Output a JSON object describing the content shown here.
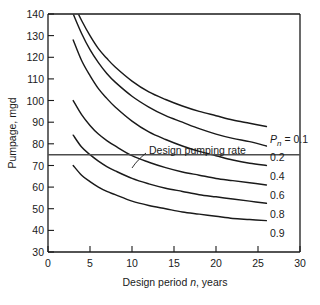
{
  "chart_data": {
    "type": "line",
    "title": "",
    "xlabel": "Design period n, years",
    "ylabel": "Pumpage, mgd",
    "xlim": [
      0,
      30
    ],
    "ylim": [
      30,
      140
    ],
    "xticks": [
      0,
      5,
      10,
      15,
      20,
      25,
      30
    ],
    "xtick_labels": [
      "0",
      "5",
      "10",
      "15",
      "20",
      "25",
      "30"
    ],
    "yticks": [
      30,
      40,
      50,
      60,
      70,
      80,
      90,
      100,
      110,
      120,
      130,
      140
    ],
    "ytick_labels": [
      "30",
      "40",
      "50",
      "60",
      "70",
      "80",
      "90",
      "100",
      "110",
      "120",
      "130",
      "140"
    ],
    "grid": false,
    "legend_position": "right-inline",
    "series_param_symbol": "P",
    "series_param_subscript": "n",
    "series": [
      {
        "name": "Pn = 0.1",
        "label": "0.1",
        "label_prefix": "P",
        "label_subscript": "n",
        "label_equals": "= 0.1",
        "x": [
          3,
          4,
          5,
          6,
          7,
          8,
          10,
          12,
          14,
          16,
          18,
          20,
          22,
          24,
          26
        ],
        "y": [
          145,
          137,
          130,
          124,
          119.5,
          115.5,
          109,
          104,
          100.5,
          97.5,
          95,
          93,
          91,
          89.5,
          88
        ]
      },
      {
        "name": "Pn = 0.2",
        "label": "0.2",
        "x": [
          3,
          4,
          5,
          6,
          7,
          8,
          10,
          12,
          14,
          16,
          18,
          20,
          22,
          24,
          26
        ],
        "y": [
          140,
          131,
          123.5,
          117.5,
          112.5,
          108.5,
          102,
          97,
          93,
          90,
          87,
          84.5,
          82.5,
          81,
          79
        ]
      },
      {
        "name": "Pn = 0.4",
        "label": "0.4",
        "x": [
          3,
          4,
          5,
          6,
          7,
          8,
          10,
          12,
          14,
          16,
          18,
          20,
          22,
          24,
          26
        ],
        "y": [
          128,
          118.5,
          111.5,
          105.5,
          101,
          97,
          90.5,
          85.5,
          82,
          79,
          76.5,
          74.5,
          72.5,
          71,
          70
        ]
      },
      {
        "name": "Pn = 0.6",
        "label": "0.6",
        "x": [
          3,
          4,
          5,
          6,
          7,
          8,
          10,
          12,
          14,
          16,
          18,
          20,
          22,
          24,
          26
        ],
        "y": [
          100,
          93.5,
          88.5,
          84.5,
          81.5,
          79,
          74.5,
          71.5,
          69,
          67,
          65.5,
          64,
          63,
          62,
          61
        ]
      },
      {
        "name": "Pn = 0.8",
        "label": "0.8",
        "x": [
          3,
          4,
          5,
          6,
          7,
          8,
          10,
          12,
          14,
          16,
          18,
          20,
          22,
          24,
          26
        ],
        "y": [
          84,
          78.5,
          75,
          72,
          69.5,
          67.5,
          64,
          61.5,
          59.5,
          58,
          56.5,
          55.5,
          54.5,
          53.5,
          52.5
        ]
      },
      {
        "name": "Pn = 0.9",
        "label": "0.9",
        "x": [
          3,
          4,
          5,
          6,
          7,
          8,
          10,
          12,
          14,
          16,
          18,
          20,
          22,
          24,
          26
        ],
        "y": [
          70,
          65.5,
          62.5,
          60,
          58,
          56.5,
          53.5,
          51.5,
          50,
          48.5,
          47.5,
          46.5,
          45.5,
          45,
          44.5
        ]
      }
    ],
    "annotations": [
      {
        "text": "Design pumping rate",
        "value": 75,
        "type": "horizontal-line",
        "x_text": 11.5,
        "y_text": 87
      }
    ],
    "colors": {
      "curve": "#1a1a1a",
      "axis": "#1a1a1a",
      "reference_line": "#4d4d4d",
      "background": "#ffffff"
    }
  }
}
